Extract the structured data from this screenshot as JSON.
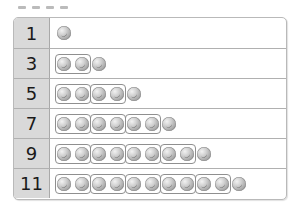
{
  "diagram": {
    "item_icon": "ball-icon",
    "group_size": 2,
    "rows": [
      {
        "label": "1",
        "count": 1
      },
      {
        "label": "3",
        "count": 3
      },
      {
        "label": "5",
        "count": 5
      },
      {
        "label": "7",
        "count": 7
      },
      {
        "label": "9",
        "count": 9
      },
      {
        "label": "11",
        "count": 11
      }
    ]
  }
}
